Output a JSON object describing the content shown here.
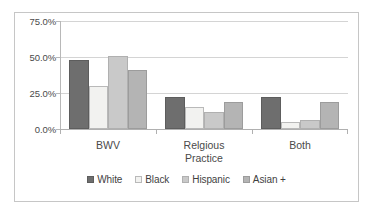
{
  "chart_data": {
    "type": "bar",
    "title": "",
    "xlabel": "",
    "ylabel": "",
    "ylim": [
      0,
      75
    ],
    "grid": true,
    "legend_position": "bottom",
    "categories": [
      "BWV",
      "Relgious Practice",
      "Both"
    ],
    "ytick_labels": [
      "75.0%",
      "50.0%",
      "25.0%",
      "0.0%"
    ],
    "ytick_values": [
      75,
      50,
      25,
      0
    ],
    "series": [
      {
        "name": "White",
        "color": "#6e6e6e",
        "values": [
          48,
          22,
          22
        ]
      },
      {
        "name": "Black",
        "color": "#f2f2f0",
        "values": [
          30,
          15,
          5
        ]
      },
      {
        "name": "Hispanic",
        "color": "#c9c9c9",
        "values": [
          51,
          12,
          6.5
        ]
      },
      {
        "name": "Asian +",
        "color": "#b4b4b4",
        "values": [
          41,
          19,
          19
        ]
      }
    ]
  },
  "legend": {
    "items": [
      {
        "label": "White"
      },
      {
        "label": "Black"
      },
      {
        "label": "Hispanic"
      },
      {
        "label": "Asian +"
      }
    ]
  },
  "axis": {
    "y_labels": [
      "75.0%",
      "50.0%",
      "25.0%",
      "0.0%"
    ]
  },
  "categories": {
    "items": [
      {
        "line1": "BWV",
        "line2": ""
      },
      {
        "line1": "Relgious",
        "line2": "Practice"
      },
      {
        "line1": "Both",
        "line2": ""
      }
    ]
  }
}
